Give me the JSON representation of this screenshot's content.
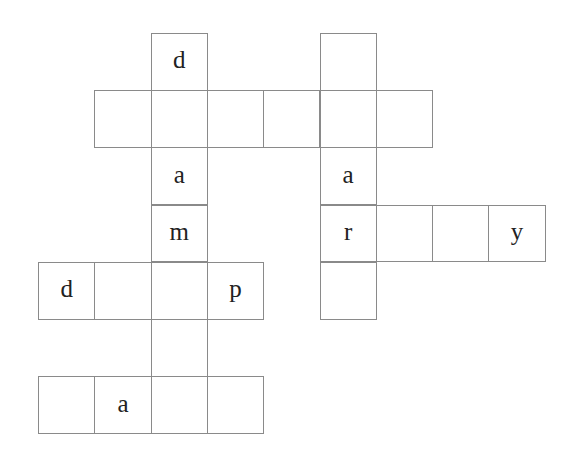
{
  "puzzle": {
    "type": "crossword",
    "grid_origin": {
      "x": 38,
      "y": 33
    },
    "cell_size": {
      "w": 56.3,
      "h": 57.2
    },
    "cells": [
      {
        "row": 0,
        "col": 2,
        "letter": "d"
      },
      {
        "row": 1,
        "col": 1,
        "letter": ""
      },
      {
        "row": 1,
        "col": 2,
        "letter": ""
      },
      {
        "row": 1,
        "col": 3,
        "letter": ""
      },
      {
        "row": 1,
        "col": 4,
        "letter": ""
      },
      {
        "row": 1,
        "col": 5,
        "letter": ""
      },
      {
        "row": 1,
        "col": 6,
        "letter": ""
      },
      {
        "row": 0,
        "col": 5,
        "letter": ""
      },
      {
        "row": 2,
        "col": 2,
        "letter": "a"
      },
      {
        "row": 2,
        "col": 5,
        "letter": "a"
      },
      {
        "row": 3,
        "col": 2,
        "letter": "m"
      },
      {
        "row": 3,
        "col": 5,
        "letter": "r"
      },
      {
        "row": 3,
        "col": 6,
        "letter": ""
      },
      {
        "row": 3,
        "col": 7,
        "letter": ""
      },
      {
        "row": 3,
        "col": 8,
        "letter": "y"
      },
      {
        "row": 4,
        "col": 0,
        "letter": "d"
      },
      {
        "row": 4,
        "col": 1,
        "letter": ""
      },
      {
        "row": 4,
        "col": 2,
        "letter": ""
      },
      {
        "row": 4,
        "col": 3,
        "letter": "p"
      },
      {
        "row": 4,
        "col": 5,
        "letter": ""
      },
      {
        "row": 5,
        "col": 2,
        "letter": ""
      },
      {
        "row": 6,
        "col": 0,
        "letter": ""
      },
      {
        "row": 6,
        "col": 1,
        "letter": "a"
      },
      {
        "row": 6,
        "col": 2,
        "letter": ""
      },
      {
        "row": 6,
        "col": 3,
        "letter": ""
      }
    ]
  }
}
